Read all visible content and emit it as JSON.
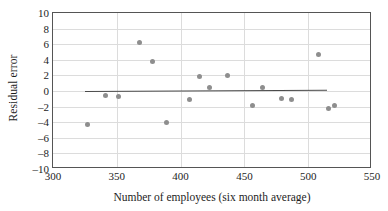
{
  "chart_data": {
    "type": "scatter",
    "title": "",
    "xlabel": "Number of employees (six month average)",
    "ylabel": "Residual error",
    "xlim": [
      300,
      550
    ],
    "ylim": [
      -10,
      10
    ],
    "xticks": [
      300,
      350,
      400,
      450,
      500,
      550
    ],
    "yticks": [
      10,
      8,
      6,
      4,
      2,
      0,
      -2,
      -4,
      -6,
      -8,
      -10
    ],
    "grid": true,
    "legend": "none",
    "point_color": "#8e8e8e",
    "line_color": "#4a4a4a",
    "grid_color": "#dcdcdc",
    "frame_color": "#555555",
    "points": [
      {
        "x": 327,
        "y": -4.3
      },
      {
        "x": 341,
        "y": -0.6
      },
      {
        "x": 351,
        "y": -0.7
      },
      {
        "x": 368,
        "y": 6.2
      },
      {
        "x": 378,
        "y": 3.8
      },
      {
        "x": 389,
        "y": -4.0
      },
      {
        "x": 407,
        "y": -1.1
      },
      {
        "x": 415,
        "y": 1.8
      },
      {
        "x": 423,
        "y": 0.4
      },
      {
        "x": 437,
        "y": 2.0
      },
      {
        "x": 456,
        "y": -1.8
      },
      {
        "x": 464,
        "y": 0.4
      },
      {
        "x": 479,
        "y": -0.9
      },
      {
        "x": 487,
        "y": -1.1
      },
      {
        "x": 508,
        "y": 4.7
      },
      {
        "x": 516,
        "y": -2.2
      },
      {
        "x": 521,
        "y": -1.8
      }
    ],
    "trendline": {
      "x_start": 325,
      "x_end": 515,
      "y_start": -0.05,
      "y_end": 0.12
    }
  }
}
